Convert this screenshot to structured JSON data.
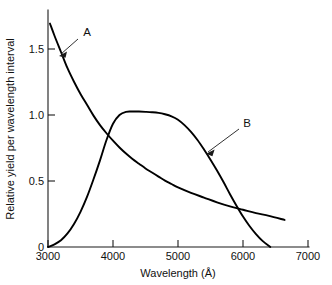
{
  "chart_data": {
    "type": "line",
    "title": "",
    "xlabel": "Wavelength  (Å)",
    "ylabel": "Relative  yield  per  wavelength  interval",
    "xlim": [
      3000,
      7000
    ],
    "ylim": [
      0,
      1.75
    ],
    "xticks": [
      3000,
      4000,
      5000,
      6000,
      7000
    ],
    "xtick_labels": [
      "3000",
      "4000",
      "5000",
      "6000",
      "7000"
    ],
    "yticks": [
      0,
      0.5,
      1.0,
      1.5
    ],
    "ytick_labels": [
      "0",
      "0.5",
      "1.0",
      "1.5"
    ],
    "grid": false,
    "legend_position": "inline-annotations",
    "annotations": [
      {
        "label": "A",
        "target_x": 3250,
        "target_y": 1.39,
        "text_x": 3700,
        "text_y": 1.56
      },
      {
        "label": "B",
        "target_x": 5480,
        "target_y": 0.72,
        "text_x": 5960,
        "text_y": 0.9
      }
    ],
    "series": [
      {
        "name": "A",
        "label": "A",
        "color": "#000000",
        "x": [
          3030,
          3100,
          3200,
          3300,
          3400,
          3500,
          3600,
          3700,
          3800,
          3900,
          4000,
          4100,
          4200,
          4300,
          4400,
          4500,
          4600,
          4700,
          4800,
          4900,
          5000,
          5200,
          5400,
          5600,
          5800,
          6000,
          6200,
          6400,
          6640
        ],
        "y": [
          1.65,
          1.56,
          1.44,
          1.32,
          1.22,
          1.13,
          1.05,
          0.97,
          0.9,
          0.84,
          0.785,
          0.735,
          0.69,
          0.65,
          0.615,
          0.58,
          0.55,
          0.52,
          0.49,
          0.465,
          0.44,
          0.4,
          0.365,
          0.33,
          0.3,
          0.275,
          0.25,
          0.23,
          0.2
        ]
      },
      {
        "name": "B",
        "label": "B",
        "color": "#000000",
        "x": [
          3000,
          3100,
          3200,
          3300,
          3400,
          3500,
          3600,
          3700,
          3800,
          3900,
          4000,
          4100,
          4200,
          4300,
          4400,
          4500,
          4600,
          4700,
          4800,
          4900,
          5000,
          5100,
          5200,
          5300,
          5400,
          5500,
          5600,
          5700,
          5800,
          5900,
          6000,
          6100,
          6200,
          6300,
          6420
        ],
        "y": [
          0.0,
          0.02,
          0.05,
          0.1,
          0.17,
          0.26,
          0.37,
          0.5,
          0.64,
          0.79,
          0.91,
          0.975,
          0.998,
          1.0,
          1.0,
          0.998,
          0.995,
          0.99,
          0.98,
          0.965,
          0.94,
          0.9,
          0.85,
          0.79,
          0.72,
          0.645,
          0.565,
          0.48,
          0.39,
          0.305,
          0.225,
          0.155,
          0.095,
          0.045,
          0.0
        ]
      }
    ]
  },
  "axes": {
    "x_axis_name": "wavelength-axis",
    "y_axis_name": "relative-yield-axis"
  }
}
